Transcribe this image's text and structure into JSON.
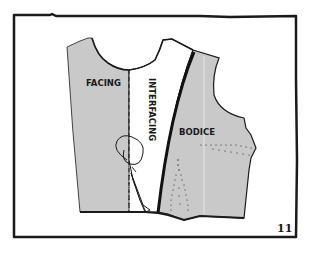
{
  "figure": {
    "number": "11",
    "labels": {
      "facing": "FACING",
      "interfacing": "INTERFACING",
      "bodice": "BODICE"
    },
    "colors": {
      "background": "#ffffff",
      "fabric_fill": "#c9c9c9",
      "ink": "#1a1a1a",
      "frame": "#1a1a1a"
    }
  }
}
